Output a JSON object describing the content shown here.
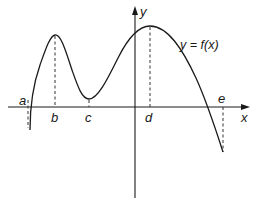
{
  "diagram": {
    "axes": {
      "x_label": "x",
      "y_label": "y"
    },
    "curve_label": "y = f(x)",
    "points": [
      {
        "id": "a",
        "label": "a",
        "description": "left endpoint / root"
      },
      {
        "id": "b",
        "label": "b",
        "description": "local maximum"
      },
      {
        "id": "c",
        "label": "c",
        "description": "local minimum"
      },
      {
        "id": "d",
        "label": "d",
        "description": "local maximum"
      },
      {
        "id": "e",
        "label": "e",
        "description": "root near right endpoint"
      }
    ],
    "colors": {
      "curve": "#1a1a1a",
      "axes": "#1a1a1a",
      "dashed": "#333333",
      "background": "#ffffff"
    }
  }
}
